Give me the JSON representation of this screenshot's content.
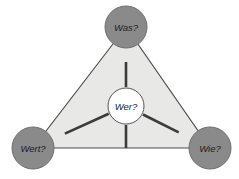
{
  "diagram": {
    "type": "triangle-hub-and-spoke",
    "background_color": "#ffffff",
    "triangle": {
      "fill_color": "#e8e8e6",
      "stroke_color": "#4a4a4a",
      "vertices": [
        {
          "x": 126,
          "y": 27
        },
        {
          "x": 33,
          "y": 148
        },
        {
          "x": 210,
          "y": 148
        }
      ]
    },
    "spoke": {
      "stroke_color": "#3b3b3b",
      "width": 2.6
    },
    "nodes": [
      {
        "id": "node-was",
        "label": "Was?",
        "position": "top",
        "cx": 126,
        "cy": 27,
        "r": 21,
        "fill_color": "#8a8a8a",
        "stroke_color": "#6f6f6f",
        "label_tone": "on-dark"
      },
      {
        "id": "node-wert",
        "label": "Wert?",
        "position": "bottom-left",
        "cx": 33,
        "cy": 148,
        "r": 21,
        "fill_color": "#8a8a8a",
        "stroke_color": "#6f6f6f",
        "label_tone": "on-dark"
      },
      {
        "id": "node-wie",
        "label": "Wie?",
        "position": "bottom-right",
        "cx": 210,
        "cy": 148,
        "r": 21,
        "fill_color": "#8a8a8a",
        "stroke_color": "#6f6f6f",
        "label_tone": "on-dark"
      },
      {
        "id": "node-wer",
        "label": "Wer?",
        "position": "center",
        "cx": 126,
        "cy": 106,
        "r": 18,
        "fill_color": "#ffffff",
        "stroke_color": "#55555a",
        "label_tone": "on-light"
      }
    ],
    "connections": [
      {
        "from": "node-wer",
        "to": "node-was"
      },
      {
        "from": "node-wer",
        "to": "node-wert"
      },
      {
        "from": "node-wer",
        "to": "node-wie"
      }
    ]
  }
}
